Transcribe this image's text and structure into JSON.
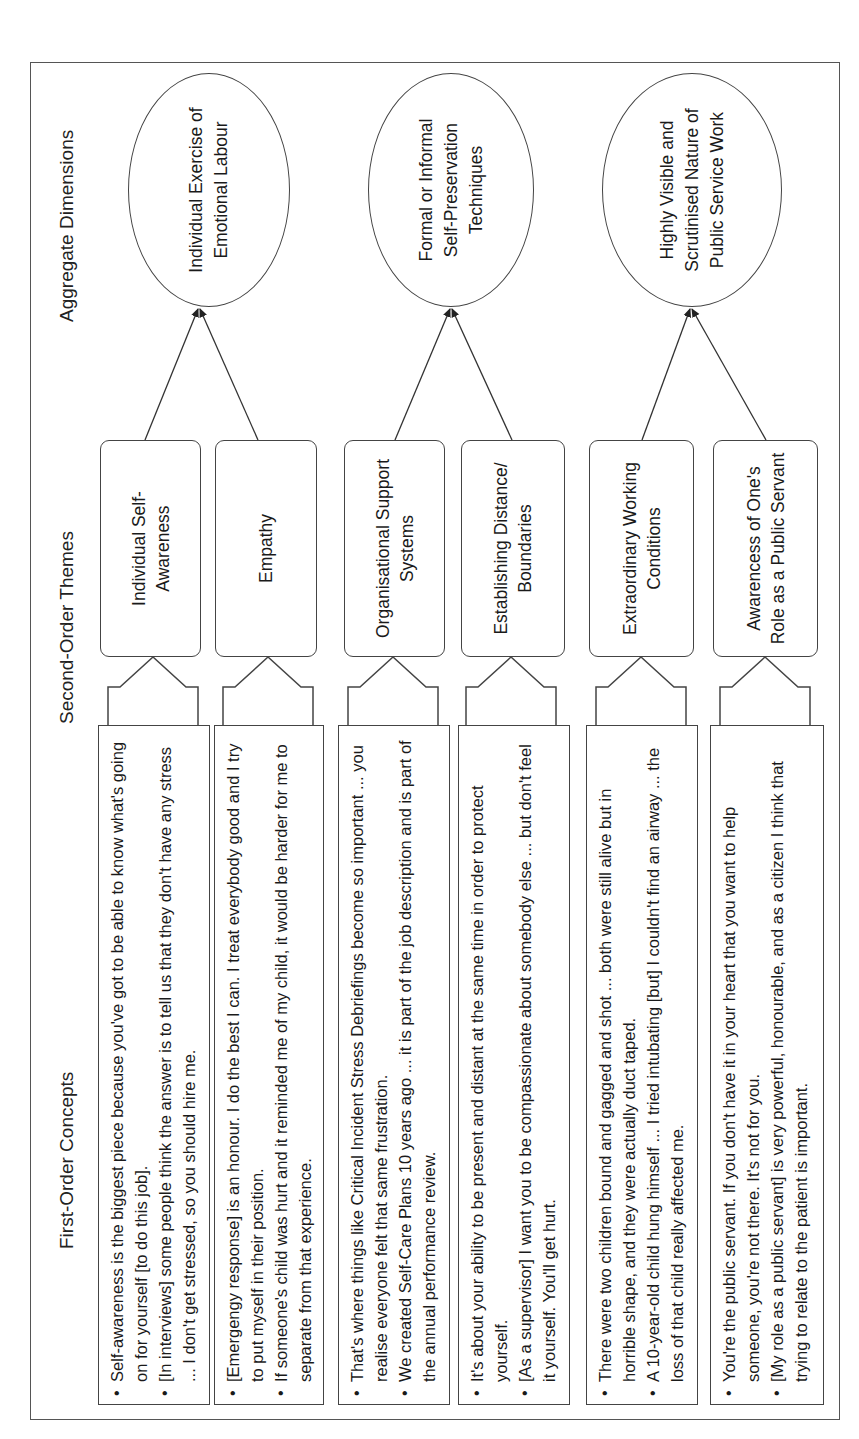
{
  "orientation": "rotated-90-ccw",
  "headers": {
    "first_order": "First-Order Concepts",
    "second_order": "Second-Order Themes",
    "aggregate": "Aggregate Dimensions"
  },
  "first_order_concepts": [
    {
      "bullets": [
        "Self-awareness is the biggest piece because you've got to be able to know what's going on for yourself [to do this job].",
        "[In interviews] some people think the answer is to tell us that they don't have any stress ... I don't get stressed, so you should hire me."
      ]
    },
    {
      "bullets": [
        "[Emergengy response] is an honour. I do the best I can. I treat everybody good and I try to put myself in their position.",
        "If someone's child was hurt and it reminded me of my child, it would be harder for me to separate from that experience."
      ]
    },
    {
      "bullets": [
        "That's where things like Critical Incident Stress Debriefings become so important ... you realise everyone felt that same frustration.",
        "We created Self-Care Plans 10 years ago ... it is part of the job description and is part of the annual performance review."
      ]
    },
    {
      "bullets": [
        "It's about your ability to be present and distant at the same time in order to protect yourself.",
        "[As a supervisor] I want you to be compassionate about somebody else ... but don't feel it yourself. You'll get hurt."
      ]
    },
    {
      "bullets": [
        "There were two children bound and gagged and shot ... both were still alive but in horrible shape, and they were actually duct taped.",
        "A 10-year-old child hung himself ... I tried intubating [but] I couldn't find an airway ... the loss of that child really affected me."
      ]
    },
    {
      "bullets": [
        "You're the public servant. If you don't have it in your heart that you want to help someone, you're not there. It's not for you.",
        "[My role as a public servant] is very powerful, honourable, and as a citizen I think that trying to relate to the patient is important."
      ]
    }
  ],
  "second_order_themes": [
    {
      "label": "Individual Self-Awareness"
    },
    {
      "label": "Empathy"
    },
    {
      "label": "Organisational Support Systems"
    },
    {
      "label": "Establishing Distance/ Boundaries"
    },
    {
      "label": "Extraordinary Working Conditions"
    },
    {
      "label": "Awarencess of One's Role as a Public Servant"
    }
  ],
  "aggregate_dimensions": [
    {
      "label": "Individual Exercise of Emotional Labour"
    },
    {
      "label": "Formal or Informal Self-Preservation Techniques"
    },
    {
      "label": "Highly Visible and Scrutinised Nature of Public Service Work"
    }
  ],
  "colors": {
    "stroke": "#444444",
    "background": "#ffffff",
    "text": "#1a1a1a"
  }
}
